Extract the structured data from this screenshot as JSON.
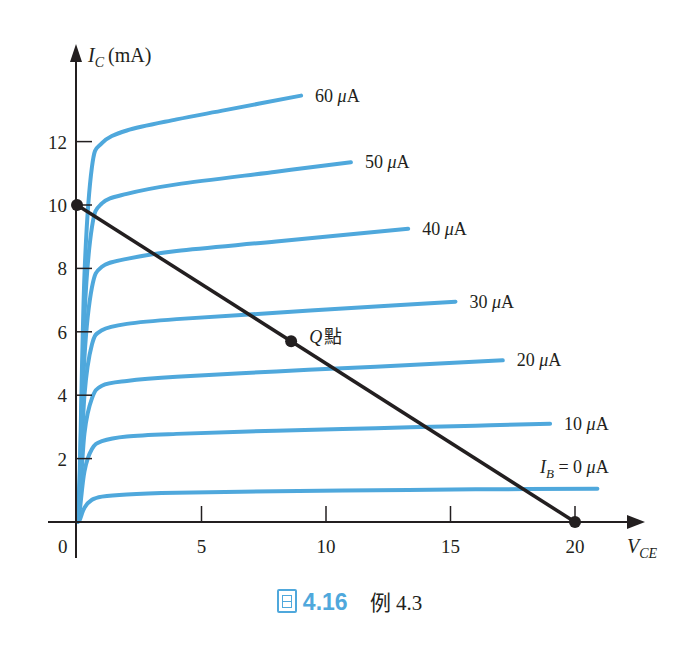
{
  "colors": {
    "curve": "#4fa8dc",
    "axis": "#231f20",
    "load_line": "#231f20",
    "caption_accent": "#4fa8dc"
  },
  "axes": {
    "y_title_var": "I",
    "y_title_sub": "C",
    "y_title_unit": "(mA)",
    "x_title_var": "V",
    "x_title_sub": "CE",
    "origin_label": "0"
  },
  "caption": {
    "icon": "figure-icon",
    "number": "4.16",
    "text": "例 4.3"
  },
  "chart_data": {
    "type": "line",
    "title": "",
    "xlabel": "V_CE",
    "ylabel": "I_C (mA)",
    "xlim": [
      0,
      21.5
    ],
    "ylim": [
      0,
      15
    ],
    "x_ticks": [
      5,
      10,
      15,
      20
    ],
    "y_ticks": [
      2,
      4,
      6,
      8,
      10,
      12
    ],
    "grid": false,
    "legend": "inline labels at right end of each curve",
    "series": [
      {
        "name": "I_B = 0 µA",
        "label": "I_B = 0 μA",
        "x": [
          0.1,
          0.3,
          0.6,
          1,
          2,
          4,
          8,
          12,
          16,
          20.9
        ],
        "y": [
          0.05,
          0.45,
          0.7,
          0.8,
          0.87,
          0.92,
          0.97,
          1.0,
          1.03,
          1.05
        ]
      },
      {
        "name": "10 µA",
        "label": "10 μA",
        "x": [
          0.1,
          0.3,
          0.6,
          1,
          2,
          4,
          8,
          12,
          16,
          19.0
        ],
        "y": [
          0.3,
          1.6,
          2.3,
          2.55,
          2.7,
          2.78,
          2.88,
          2.96,
          3.04,
          3.1
        ]
      },
      {
        "name": "20 µA",
        "label": "20 μA",
        "x": [
          0.1,
          0.3,
          0.6,
          1,
          2,
          4,
          8,
          12,
          17.1
        ],
        "y": [
          0.5,
          2.8,
          3.9,
          4.3,
          4.45,
          4.58,
          4.75,
          4.9,
          5.1
        ]
      },
      {
        "name": "30 µA",
        "label": "30 μA",
        "x": [
          0.1,
          0.3,
          0.6,
          1,
          2,
          4,
          8,
          12,
          15.2
        ],
        "y": [
          0.7,
          4.0,
          5.6,
          6.05,
          6.25,
          6.4,
          6.6,
          6.8,
          6.95
        ]
      },
      {
        "name": "40 µA",
        "label": "40 μA",
        "x": [
          0.1,
          0.3,
          0.6,
          1,
          2,
          4,
          8,
          13.3
        ],
        "y": [
          0.9,
          5.2,
          7.4,
          8.05,
          8.3,
          8.55,
          8.85,
          9.25
        ]
      },
      {
        "name": "50 µA",
        "label": "50 μA",
        "x": [
          0.1,
          0.3,
          0.6,
          1,
          2,
          4,
          8,
          11.0
        ],
        "y": [
          1.1,
          6.5,
          9.3,
          10.05,
          10.35,
          10.65,
          11.05,
          11.35
        ]
      },
      {
        "name": "60 µA",
        "label": "60 μA",
        "x": [
          0.1,
          0.3,
          0.6,
          1,
          2,
          4,
          6,
          9.0
        ],
        "y": [
          1.3,
          7.8,
          11.2,
          11.95,
          12.35,
          12.7,
          13.0,
          13.45
        ]
      }
    ],
    "load_line": {
      "x": [
        0,
        20
      ],
      "y": [
        10,
        0
      ]
    },
    "points": [
      {
        "name": "I_C(sat)",
        "x": 0,
        "y": 10
      },
      {
        "name": "Q點",
        "x": 8.6,
        "y": 5.7,
        "label_italic": "Q",
        "label_cjk": "點"
      },
      {
        "name": "V_CE(cutoff)",
        "x": 20,
        "y": 0
      }
    ]
  }
}
